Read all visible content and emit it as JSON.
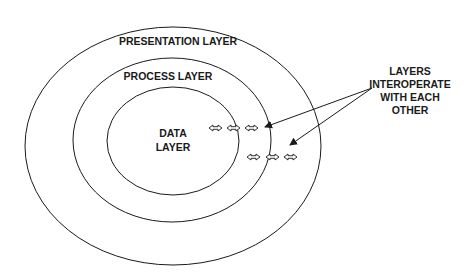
{
  "diagram": {
    "layers": [
      {
        "id": "presentation",
        "label": "PRESENTATION LAYER"
      },
      {
        "id": "process",
        "label": "PROCESS LAYER"
      },
      {
        "id": "data",
        "label_lines": [
          "DATA",
          "LAYER"
        ]
      }
    ],
    "annotation": {
      "lines": [
        "LAYERS",
        "INTEROPERATE",
        "WITH EACH",
        "OTHER"
      ]
    },
    "colors": {
      "stroke": "#1a1a1a",
      "background": "#ffffff",
      "arrow_fill": "#ffffff"
    }
  }
}
